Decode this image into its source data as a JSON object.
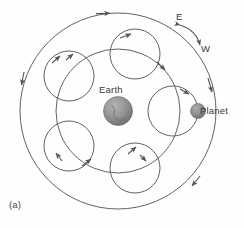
{
  "figure": {
    "panel_label": "(a)",
    "caption_kind": "ptolemaic-epicycle-diagram",
    "background_color": "#fefefe",
    "line_color": "#555555",
    "labels": {
      "earth": "Earth",
      "planet": "Planet",
      "east": "E",
      "west": "W"
    },
    "bodies": [
      {
        "name": "Earth",
        "cx": 118,
        "cy": 111,
        "r": 14.5,
        "fill": "#8c8c8c",
        "shaded": true
      },
      {
        "name": "Planet",
        "cx": 198,
        "cy": 111,
        "r": 7.5,
        "fill": "#8a8a8a",
        "shaded": true
      }
    ],
    "deferent": {
      "name": "deferent",
      "cx": 118,
      "cy": 111,
      "r": 62,
      "arrow_angles_deg": [
        28,
        152,
        208,
        332
      ]
    },
    "outer_envelope": {
      "name": "outer-envelope-circle",
      "cx": 118,
      "cy": 111,
      "r": 98,
      "arrow_angles_deg": [
        100,
        175,
        12,
        300
      ]
    },
    "epicycles": [
      {
        "name": "epicycle-right",
        "cx": 173,
        "cy": 111,
        "r": 25,
        "arrow_angle_deg": 62
      },
      {
        "name": "epicycle-upper-right",
        "cx": 135,
        "cy": 54,
        "r": 25,
        "arrow_angle_deg": 300
      },
      {
        "name": "epicycle-upper-left",
        "cx": 69,
        "cy": 76,
        "r": 25,
        "arrow_angle_deg": 340
      },
      {
        "name": "epicycle-lower-left",
        "cx": 69,
        "cy": 146,
        "r": 25,
        "arrow_angle_deg": 20
      },
      {
        "name": "epicycle-lower-right",
        "cx": 135,
        "cy": 168,
        "r": 25,
        "arrow_angle_deg": 108
      }
    ],
    "direction_arc": {
      "name": "east-west-direction-arc",
      "from": {
        "x": 178,
        "y": 24
      },
      "to": {
        "x": 201,
        "y": 47
      },
      "double_headed": true
    }
  }
}
